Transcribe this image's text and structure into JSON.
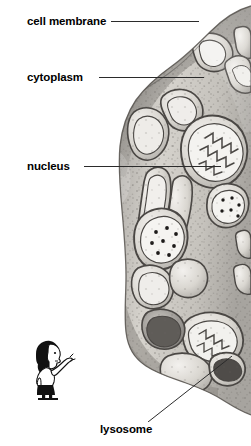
{
  "figure": {
    "background_color": "#ffffff",
    "text_color": "#000000",
    "leader_line_color": "#2b2b2b"
  },
  "labels": [
    {
      "id": "cell-membrane",
      "text": "cell membrane"
    },
    {
      "id": "cytoplasm",
      "text": "cytoplasm"
    },
    {
      "id": "nucleus",
      "text": "nucleus"
    },
    {
      "id": "lysosome",
      "text": "lysosome"
    }
  ],
  "illustration": {
    "name": "cell-cross-section",
    "description": "Grayscale pencil-shaded electron-micrograph style drawing of a cell occupying the right half of the page, showing membrane-bound organelles, mitochondria with cristae, endoplasmic reticulum channels, ribosome speckles and lysosomes.",
    "ink_color": "#3a3a3a",
    "fill_light": "#e8e6e2",
    "fill_mid": "#b9b6b1",
    "fill_dark": "#6e6b67"
  },
  "cartoon": {
    "name": "pointing-person",
    "description": "Small black-and-white cartoon of a person with dark hair and a dark skirt, pointing up and to the right toward the cell diagram.",
    "ink_color": "#111111"
  }
}
